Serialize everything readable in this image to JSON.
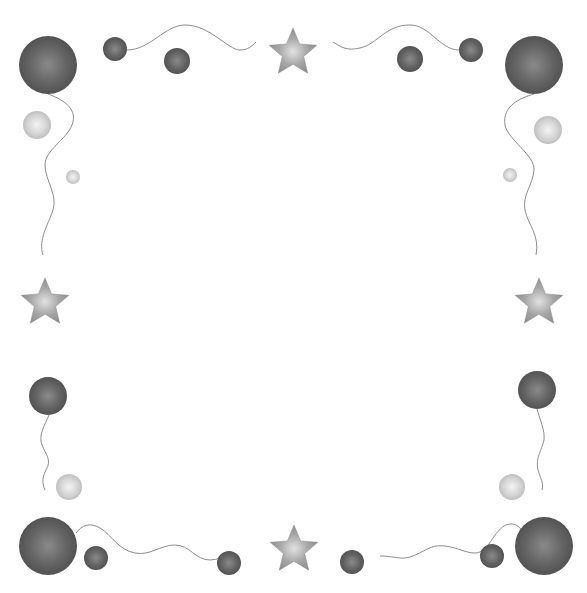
{
  "image": {
    "description": "Decorative border frame of grayscale balloons, strings and stars on white background",
    "width": 587,
    "height": 593
  },
  "colors": {
    "background": "#ffffff",
    "balloon_dark": "#5a5a5a",
    "balloon_dark_highlight": "#8a8a8a",
    "balloon_light": "#c8c8c8",
    "balloon_light_highlight": "#f0f0f0",
    "star": "#9a9a9a",
    "star_highlight": "#dcdcdc",
    "string": "#8c8c8c"
  },
  "balloons": [
    {
      "id": "tl-big",
      "cx": 48,
      "cy": 65,
      "r": 29,
      "tone": "dark"
    },
    {
      "id": "top-1",
      "cx": 115,
      "cy": 49,
      "r": 12,
      "tone": "dark"
    },
    {
      "id": "top-2",
      "cx": 177,
      "cy": 61,
      "r": 13,
      "tone": "dark"
    },
    {
      "id": "top-3",
      "cx": 410,
      "cy": 59,
      "r": 13,
      "tone": "dark"
    },
    {
      "id": "top-4",
      "cx": 471,
      "cy": 50,
      "r": 12,
      "tone": "dark"
    },
    {
      "id": "tr-big",
      "cx": 534,
      "cy": 65,
      "r": 29,
      "tone": "dark"
    },
    {
      "id": "left-light",
      "cx": 37,
      "cy": 125,
      "r": 14,
      "tone": "light"
    },
    {
      "id": "left-tiny",
      "cx": 73,
      "cy": 177,
      "r": 7,
      "tone": "light"
    },
    {
      "id": "right-light",
      "cx": 548,
      "cy": 130,
      "r": 14,
      "tone": "light"
    },
    {
      "id": "right-tiny",
      "cx": 510,
      "cy": 175,
      "r": 7,
      "tone": "light"
    },
    {
      "id": "left-mid",
      "cx": 48,
      "cy": 396,
      "r": 19,
      "tone": "dark"
    },
    {
      "id": "left-low-light",
      "cx": 69,
      "cy": 487,
      "r": 13,
      "tone": "light"
    },
    {
      "id": "right-mid",
      "cx": 537,
      "cy": 390,
      "r": 19,
      "tone": "dark"
    },
    {
      "id": "right-low-light",
      "cx": 512,
      "cy": 487,
      "r": 13,
      "tone": "light"
    },
    {
      "id": "bl-big",
      "cx": 48,
      "cy": 546,
      "r": 29,
      "tone": "dark"
    },
    {
      "id": "bottom-1",
      "cx": 96,
      "cy": 558,
      "r": 12,
      "tone": "dark"
    },
    {
      "id": "bottom-2",
      "cx": 229,
      "cy": 563,
      "r": 12,
      "tone": "dark"
    },
    {
      "id": "bottom-3",
      "cx": 352,
      "cy": 562,
      "r": 12,
      "tone": "dark"
    },
    {
      "id": "bottom-4",
      "cx": 492,
      "cy": 556,
      "r": 12,
      "tone": "dark"
    },
    {
      "id": "br-big",
      "cx": 544,
      "cy": 546,
      "r": 29,
      "tone": "dark"
    }
  ],
  "stars": [
    {
      "id": "top",
      "cx": 293,
      "cy": 53,
      "r": 25
    },
    {
      "id": "left",
      "cx": 45,
      "cy": 303,
      "r": 25
    },
    {
      "id": "right",
      "cx": 539,
      "cy": 303,
      "r": 25
    },
    {
      "id": "bottom",
      "cx": 294,
      "cy": 550,
      "r": 25
    }
  ],
  "strings": [
    {
      "id": "top-left",
      "d": "M127,50 C150,50 165,25 185,25 C210,25 228,50 240,50 C248,50 252,46 256,42"
    },
    {
      "id": "top-right",
      "d": "M333,42 C345,50 350,50 360,48 C378,44 385,25 410,25 C430,25 440,50 459,50"
    },
    {
      "id": "left-upper",
      "d": "M48,94 C65,100 78,110 72,125 C66,140 45,150 45,165 C45,180 58,195 53,210 C48,225 38,240 43,255"
    },
    {
      "id": "right-upper",
      "d": "M534,94 C520,98 502,106 505,125 C508,140 535,155 534,170 C533,185 522,195 525,210 C528,225 540,235 536,255"
    },
    {
      "id": "left-lower",
      "d": "M49,415 C45,425 38,435 42,445 C46,455 52,460 46,470 C42,478 42,483 45,490"
    },
    {
      "id": "right-lower",
      "d": "M537,409 C540,420 545,430 544,440 C542,450 535,458 538,470 C540,478 544,482 542,490"
    },
    {
      "id": "bottom-left",
      "d": "M76,533 C82,525 90,522 100,528 C112,535 118,550 135,553 C150,556 160,545 175,545 C190,545 195,560 210,560 C218,560 222,556 230,556"
    },
    {
      "id": "bottom-right",
      "d": "M380,556 C395,556 400,560 410,557 C425,552 430,544 445,546 C460,548 465,553 475,553 C490,553 495,525 510,524 C518,523 522,530 526,537"
    }
  ]
}
